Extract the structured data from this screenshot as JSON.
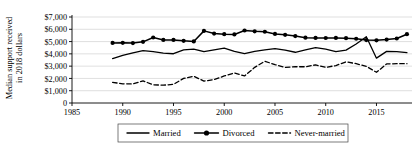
{
  "chart_data": {
    "type": "line",
    "title": "",
    "xlabel": "",
    "ylabel": "Median support received\nin 2018 dollars",
    "xlim": [
      1985,
      2018.5
    ],
    "ylim": [
      0,
      7000
    ],
    "xticks": [
      1985,
      1990,
      1995,
      2000,
      2005,
      2010,
      2015
    ],
    "xticklabels": [
      "1985",
      "1990",
      "1995",
      "2000",
      "2005",
      "2010",
      "2015"
    ],
    "yticks": [
      0,
      1000,
      2000,
      3000,
      4000,
      5000,
      6000,
      7000
    ],
    "yticklabels": [
      "0",
      "$1,000",
      "$2,000",
      "$3,000",
      "$4,000",
      "$5,000",
      "$6,000",
      "$7,000"
    ],
    "grid": "horizontal",
    "legend_position": "bottom",
    "x": [
      1989,
      1990,
      1991,
      1992,
      1993,
      1994,
      1995,
      1996,
      1997,
      1998,
      1999,
      2000,
      2001,
      2002,
      2003,
      2004,
      2005,
      2006,
      2007,
      2008,
      2009,
      2010,
      2011,
      2012,
      2013,
      2014,
      2015,
      2016,
      2017,
      2018
    ],
    "series": [
      {
        "name": "Married",
        "style": "solid",
        "marker": "none",
        "color": "#000000",
        "values": [
          3620,
          3880,
          4080,
          4260,
          4180,
          4060,
          4010,
          4320,
          4390,
          4180,
          4330,
          4460,
          4200,
          4020,
          4200,
          4330,
          4420,
          4300,
          4130,
          4320,
          4500,
          4380,
          4190,
          4300,
          4800,
          5400,
          3650,
          4200,
          4180,
          4100
        ]
      },
      {
        "name": "Divorced",
        "style": "solid",
        "marker": "circle",
        "color": "#000000",
        "values": [
          4890,
          4900,
          4880,
          4980,
          5330,
          5130,
          5130,
          5060,
          5010,
          5870,
          5650,
          5600,
          5580,
          5900,
          5830,
          5800,
          5620,
          5550,
          5450,
          5320,
          5300,
          5290,
          5300,
          5280,
          5230,
          5120,
          5100,
          5160,
          5250,
          5600
        ]
      },
      {
        "name": "Never-married",
        "style": "dashed",
        "marker": "none",
        "color": "#000000",
        "values": [
          1680,
          1560,
          1550,
          1800,
          1480,
          1450,
          1520,
          2000,
          2180,
          1780,
          1900,
          2200,
          2450,
          2200,
          2900,
          3400,
          3120,
          2900,
          2950,
          2950,
          3100,
          2900,
          3050,
          3350,
          3200,
          2980,
          2500,
          3180,
          3200,
          3200
        ]
      }
    ],
    "legend": [
      {
        "label": "Married",
        "style": "solid",
        "marker": "none"
      },
      {
        "label": "Divorced",
        "style": "solid",
        "marker": "circle"
      },
      {
        "label": "Never-married",
        "style": "dashed",
        "marker": "none"
      }
    ]
  }
}
